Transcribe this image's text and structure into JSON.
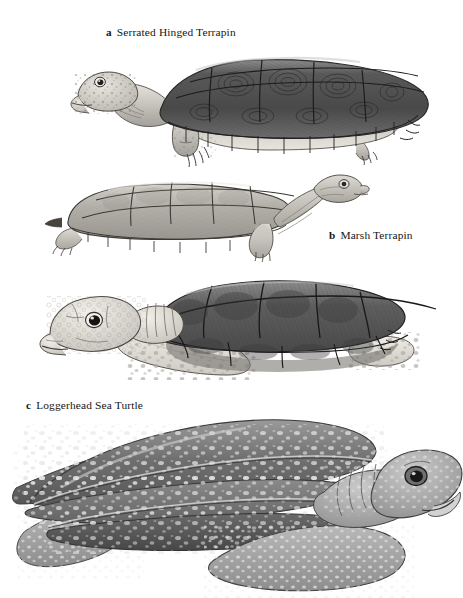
{
  "figure": {
    "kind": "scientific-illustration-plate",
    "background_color": "#ffffff",
    "ink_color": "#161616",
    "style": "grayscale pencil / stipple line drawing",
    "panel_count": 4,
    "labeled_panel_count": 3
  },
  "captions": [
    {
      "tag": "a",
      "name": "Serrated Hinged Terrapin"
    },
    {
      "tag": "b",
      "name": "Marsh Terrapin"
    },
    {
      "tag": "c",
      "name": "Loggerhead Sea Turtle"
    }
  ],
  "panels": [
    {
      "id": "a",
      "label": "Serrated Hinged Terrapin",
      "facing": "left",
      "shell": "domed, dark, serrated rear margin, concentric growth rings on scutes",
      "shell_tone": "#5d5d5d",
      "skin_tone": "#c9c6bf",
      "caption_position": "above-left"
    },
    {
      "id": "b",
      "label": "Marsh Terrapin",
      "facing": "right",
      "shell": "low, flat, pale with bold scute seams",
      "shell_tone": "#b4b1aa",
      "skin_tone": "#c4c1ba",
      "caption_position": "right"
    },
    {
      "id": "c",
      "label": "Loggerhead Sea Turtle",
      "facing": "left",
      "shell": "large dark keeled scutes, heart-shaped carapace",
      "shell_tone": "#6b6b6b",
      "skin_tone": "#dedbd4",
      "flippers": "pale, heavily spotted paddles",
      "caption_position": "below-left"
    },
    {
      "id": "d",
      "label": "",
      "facing": "right",
      "shell": "leathery carapace with longitudinal ridges and pale spots",
      "shell_tone": "#737373",
      "skin_tone": "#9a9a9a",
      "flippers": "very long spotted fore-flippers",
      "caption_position": "none"
    }
  ]
}
